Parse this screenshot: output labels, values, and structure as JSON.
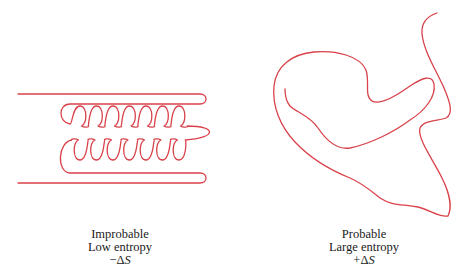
{
  "diagram": {
    "stroke_color": "#d9424a",
    "left_panel": {
      "description": "ordered coiled chain",
      "loop_count_per_row": 7,
      "caption": {
        "line1": "Improbable",
        "line2": "Low entropy",
        "line3_sign": "−",
        "line3_symbol": "Δ",
        "line3_var": "S"
      }
    },
    "right_panel": {
      "description": "disordered random chain",
      "caption": {
        "line1": "Probable",
        "line2": "Large entropy",
        "line3_sign": "+",
        "line3_symbol": "Δ",
        "line3_var": "S"
      }
    }
  }
}
